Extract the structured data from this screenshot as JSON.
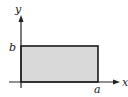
{
  "diagram": {
    "type": "rectangle-region-on-axes",
    "axes": {
      "x_label": "x",
      "y_label": "y"
    },
    "region": {
      "corners": [
        "(0,0)",
        "(a,0)",
        "(a,b)",
        "(0,b)"
      ],
      "fill": "#d9d9d9",
      "stroke": "#1a1a1a"
    },
    "tick_labels": {
      "x_mark": "a",
      "y_mark": "b"
    },
    "colors": {
      "axis": "#222222",
      "background": "#ffffff"
    }
  }
}
